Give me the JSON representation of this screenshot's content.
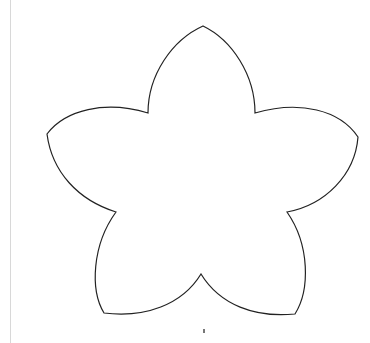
{
  "canvas": {
    "width": 370,
    "height": 343,
    "background": "#ffffff"
  },
  "shape": {
    "name": "five-petal-flower-outline",
    "stroke": "#222222",
    "fill": "#ffffff",
    "petal_tips": [
      [
        203,
        26
      ],
      [
        358,
        137
      ],
      [
        295,
        314
      ],
      [
        104,
        313
      ],
      [
        47,
        134
      ]
    ],
    "inner_vertices": [
      [
        255,
        113
      ],
      [
        287,
        212
      ],
      [
        201,
        274
      ],
      [
        116,
        212
      ],
      [
        148,
        113
      ]
    ]
  },
  "decorations": {
    "left_rule_color": "#d8d8d8"
  }
}
